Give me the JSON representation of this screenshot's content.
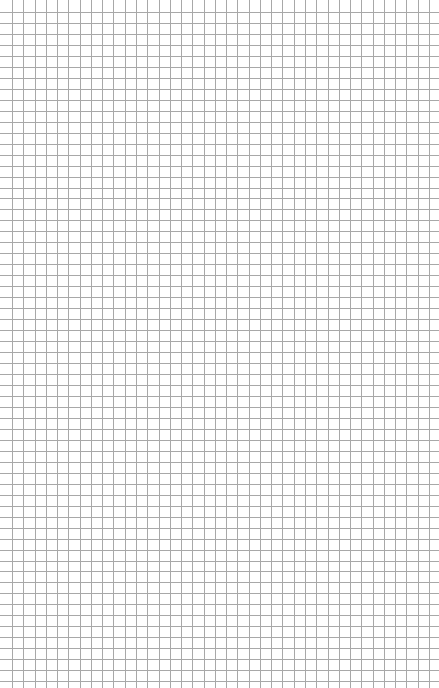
{
  "page": {
    "type": "graph-paper",
    "width": 439,
    "height": 688,
    "background": "#ffffff"
  },
  "grid": {
    "line_color": "#a8a8a8",
    "line_width": 1,
    "x_offset": 12,
    "x_spacing": 11.27,
    "x_end": 430,
    "y_offset": 12,
    "y_spacing": 10.97,
    "y_end": 688,
    "h_line_start": 0,
    "h_line_end": 439,
    "v_line_start": 0,
    "v_line_end": 688
  }
}
